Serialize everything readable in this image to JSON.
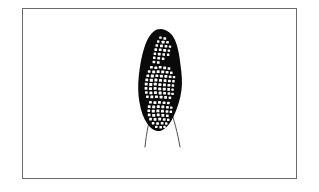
{
  "figure": {
    "caption": "",
    "background_color": "#ffffff",
    "frame": {
      "label": "illustration-border",
      "stroke_color": "#6b6b6b",
      "stroke_width": 1,
      "x": 22,
      "y": 8,
      "width": 275,
      "height": 171
    },
    "specimen": {
      "label": "specimen-body",
      "fill_color": "#0a0a0a",
      "outline_color": "#0a0a0a",
      "center_x": 161,
      "top_y": 29,
      "bottom_y": 131,
      "max_width": 44
    },
    "granules": {
      "label": "spore-granules",
      "fill_color": "#ffffff",
      "count": 118,
      "clusters": [
        {
          "name": "upper-cluster",
          "cx": 163,
          "cy": 47,
          "rx": 9,
          "ry": 12,
          "count": 22
        },
        {
          "name": "middle-cluster",
          "cx": 161,
          "cy": 83,
          "rx": 15,
          "ry": 16,
          "count": 62
        },
        {
          "name": "lower-cluster",
          "cx": 160,
          "cy": 112,
          "rx": 13,
          "ry": 10,
          "count": 34
        }
      ]
    },
    "filaments": {
      "label": "trailing-filaments",
      "stroke_color": "#3a3a3a",
      "stroke_width": 0.9,
      "count": 2,
      "left": {
        "start_x": 152,
        "start_y": 110,
        "end_x": 145,
        "end_y": 147
      },
      "right": {
        "start_x": 171,
        "start_y": 110,
        "end_x": 180,
        "end_y": 147
      }
    }
  }
}
